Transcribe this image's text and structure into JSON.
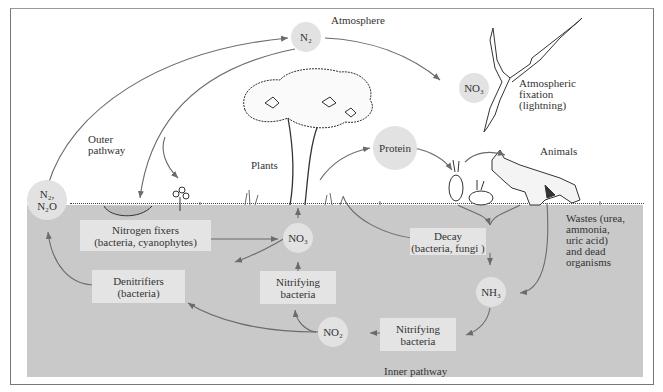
{
  "diagram": {
    "nodes": {
      "n2_atmosphere": "N₂",
      "no3_atmosphere": "NO₃",
      "protein": "Protein",
      "n2_n2o": "N₂,\nN₂O",
      "no3_soil": "NO₃",
      "nh3": "NH₃",
      "no2": "NO₂"
    },
    "boxes": {
      "nitrogen_fixers": "Nitrogen fixers\n(bacteria, cyanophytes)",
      "denitrifiers": "Denitrifiers\n(bacteria)",
      "nitrifying_upper": "Nitrifying\nbacteria",
      "nitrifying_lower": "Nitrifying\nbacteria",
      "decay": "Decay\n(bacteria, fungi )"
    },
    "labels": {
      "atmosphere": "Atmosphere",
      "atmospheric_fixation": "Atmospheric\nfixation\n(lightning)",
      "outer_pathway": "Outer\npathway",
      "plants": "Plants",
      "animals": "Animals",
      "wastes": "Wastes (urea,\nammonia,\nuric acid)\nand dead\norganisms",
      "inner_pathway": "Inner pathway"
    },
    "illustrations": [
      "tree",
      "lightning-bolt",
      "rabbits",
      "wolf",
      "pond-algae",
      "clover-plant",
      "grass"
    ],
    "colors": {
      "soil": "#c9c9c9",
      "node_fill": "#e2e2e2",
      "box_fill": "#e4e4e4",
      "arrow": "#6b6b6b"
    }
  }
}
